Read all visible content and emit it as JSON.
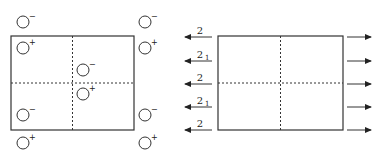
{
  "left_panel": {
    "box": {
      "x": 11,
      "y": 36,
      "w": 123,
      "h": 94
    },
    "charges": [
      {
        "x": 23,
        "y": 22,
        "sign": "−"
      },
      {
        "x": 145,
        "y": 22,
        "sign": "−"
      },
      {
        "x": 23,
        "y": 48,
        "sign": "+"
      },
      {
        "x": 145,
        "y": 48,
        "sign": "+"
      },
      {
        "x": 83,
        "y": 70,
        "sign": "−"
      },
      {
        "x": 83,
        "y": 94,
        "sign": "+"
      },
      {
        "x": 23,
        "y": 115,
        "sign": "−"
      },
      {
        "x": 145,
        "y": 115,
        "sign": "−"
      },
      {
        "x": 23,
        "y": 143,
        "sign": "+"
      },
      {
        "x": 145,
        "y": 143,
        "sign": "+"
      }
    ]
  },
  "right_panel": {
    "box": {
      "x": 218,
      "y": 36,
      "w": 125,
      "h": 94
    },
    "left_arrows": [
      {
        "y": 37,
        "label": "2",
        "sub": ""
      },
      {
        "y": 61,
        "label": "2",
        "sub": "1"
      },
      {
        "y": 84,
        "label": "2",
        "sub": ""
      },
      {
        "y": 107,
        "label": "2",
        "sub": "1"
      },
      {
        "y": 130,
        "label": "2",
        "sub": ""
      }
    ],
    "right_arrows_y": [
      37,
      61,
      84,
      107,
      130
    ]
  }
}
